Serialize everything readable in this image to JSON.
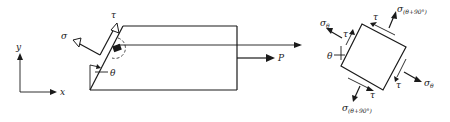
{
  "figure": {
    "left_panel": {
      "axes": {
        "x_label": "x",
        "y_label": "y"
      },
      "bar": {
        "load_label": "P",
        "normal_stress_label": "σ",
        "shear_stress_label": "τ",
        "angle_label": "θ"
      }
    },
    "right_panel": {
      "element": {
        "sigma_theta_left": "σ",
        "sigma_theta_left_sub": "θ",
        "sigma_theta_right": "σ",
        "sigma_theta_right_sub": "θ",
        "sigma_perp_top": "σ",
        "sigma_perp_top_sub": "(θ+90°)",
        "sigma_perp_bottom": "σ",
        "sigma_perp_bottom_sub": "(θ+90°)",
        "tau_left": "τ",
        "tau_top": "τ",
        "tau_right": "τ",
        "tau_bottom": "τ",
        "angle_label": "θ"
      }
    },
    "colors": {
      "ink": "#1a1a1a",
      "background": "#ffffff"
    }
  }
}
